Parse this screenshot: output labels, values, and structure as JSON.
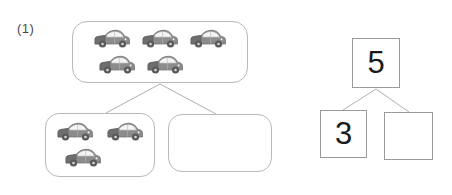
{
  "worksheet": {
    "problem_label": "(1)",
    "ink_color": "#b9b9b9",
    "number_ink_color": "#9a9a9a",
    "text_color": "#1a1a1a",
    "car_body_color": "#8c8c8c",
    "car_dark_color": "#6e6e6e",
    "car_window_color": "#f2f2f2",
    "car_wheel_color": "#5a5a5a"
  },
  "picture_bond": {
    "whole": {
      "name": "top-group",
      "icon": "car-icon",
      "count": 5,
      "rows": [
        3,
        2
      ],
      "filled": true
    },
    "parts": [
      {
        "name": "left-group",
        "icon": "car-icon",
        "count": 3,
        "rows": [
          2,
          1
        ],
        "filled": true
      },
      {
        "name": "right-group",
        "icon": "car-icon",
        "count": 0,
        "rows": [],
        "filled": false
      }
    ]
  },
  "number_bond": {
    "whole": {
      "value": "5",
      "blank": false
    },
    "parts": [
      {
        "value": "3",
        "blank": false
      },
      {
        "value": "",
        "blank": true
      }
    ]
  }
}
